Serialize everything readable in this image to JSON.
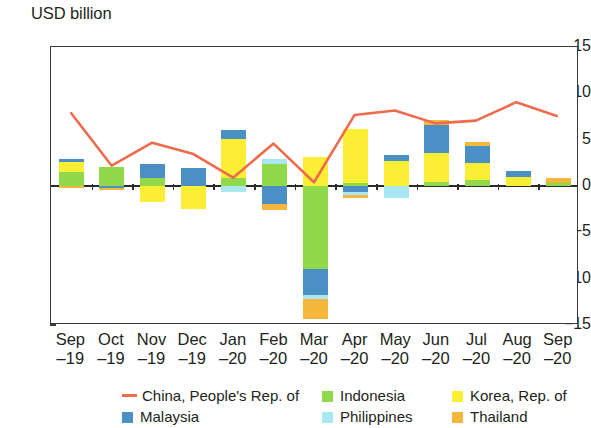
{
  "chart_data": {
    "type": "bar",
    "subtype": "stacked-bar-with-line-overlay",
    "title": "",
    "ylabel": "USD billion",
    "xlabel": "",
    "ylim": [
      -15,
      15
    ],
    "yticks": [
      15,
      10,
      5,
      0,
      -5,
      -10,
      -15
    ],
    "ytick_labels": [
      "15",
      "10",
      "5",
      "0",
      "-5",
      "-10",
      "-15"
    ],
    "grid": false,
    "legend_position": "below-axis",
    "categories": [
      "Sep-19",
      "Oct-19",
      "Nov-19",
      "Dec-19",
      "Jan-20",
      "Feb-20",
      "Mar-20",
      "Apr-20",
      "May-20",
      "Jun-20",
      "Jul-20",
      "Aug-20",
      "Sep-20"
    ],
    "category_labels": [
      {
        "line1": "Sep",
        "line2": "-19"
      },
      {
        "line1": "Oct",
        "line2": "-19"
      },
      {
        "line1": "Nov",
        "line2": "-19"
      },
      {
        "line1": "Dec",
        "line2": "-19"
      },
      {
        "line1": "Jan",
        "line2": "-20"
      },
      {
        "line1": "Feb",
        "line2": "-20"
      },
      {
        "line1": "Mar",
        "line2": "-20"
      },
      {
        "line1": "Apr",
        "line2": "-20"
      },
      {
        "line1": "May",
        "line2": "-20"
      },
      {
        "line1": "Jun",
        "line2": "-20"
      },
      {
        "line1": "Jul",
        "line2": "-20"
      },
      {
        "line1": "Aug",
        "line2": "-20"
      },
      {
        "line1": "Sep",
        "line2": "-20"
      }
    ],
    "series": [
      {
        "name": "Indonesia",
        "type": "bar",
        "color": "#8FD94B",
        "values": [
          1.5,
          2.0,
          0.9,
          0.0,
          0.9,
          2.4,
          -9.0,
          0.3,
          0.0,
          0.4,
          0.6,
          0.0,
          0.35
        ]
      },
      {
        "name": "Korea, Rep. of",
        "type": "bar",
        "color": "#FCEE35",
        "values": [
          1.1,
          0.0,
          -1.7,
          -2.5,
          4.2,
          0.0,
          3.1,
          5.9,
          2.7,
          3.2,
          1.9,
          1.0,
          0.0
        ]
      },
      {
        "name": "Malaysia",
        "type": "bar",
        "color": "#4A90C4",
        "values": [
          0.3,
          -0.2,
          1.5,
          1.9,
          0.9,
          -1.9,
          -2.8,
          -0.7,
          0.6,
          3.0,
          1.8,
          0.6,
          0.0
        ]
      },
      {
        "name": "Philippines",
        "type": "bar",
        "color": "#A9E8F2",
        "values": [
          0.0,
          0.0,
          0.0,
          0.0,
          -0.7,
          0.5,
          -0.4,
          -0.3,
          -1.3,
          0.0,
          0.0,
          0.0,
          0.0
        ]
      },
      {
        "name": "Thailand",
        "type": "bar",
        "color": "#F5B63D",
        "values": [
          -0.2,
          -0.2,
          0.0,
          0.0,
          0.0,
          -0.7,
          -2.2,
          -0.3,
          0.0,
          0.5,
          0.5,
          0.0,
          0.55
        ]
      },
      {
        "name": "China, People's Rep. of",
        "type": "line",
        "color": "#EE6B4D",
        "values": [
          7.8,
          2.1,
          4.6,
          3.4,
          0.8,
          4.5,
          0.3,
          7.6,
          8.1,
          6.7,
          7.0,
          9.0,
          7.5
        ]
      }
    ]
  },
  "legend": {
    "items": [
      {
        "label": "China, People's Rep. of",
        "color": "#EE6B4D",
        "marker": "line"
      },
      {
        "label": "Indonesia",
        "color": "#8FD94B",
        "marker": "square"
      },
      {
        "label": "Korea, Rep. of",
        "color": "#FCEE35",
        "marker": "square"
      },
      {
        "label": "Malaysia",
        "color": "#4A90C4",
        "marker": "square"
      },
      {
        "label": "Philippines",
        "color": "#A9E8F2",
        "marker": "square"
      },
      {
        "label": "Thailand",
        "color": "#F5B63D",
        "marker": "square"
      }
    ]
  },
  "axis": {
    "y_title": "USD billion"
  }
}
